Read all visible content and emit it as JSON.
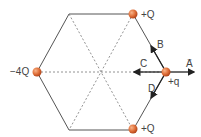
{
  "diagram": {
    "shape": "regular hexagon",
    "charges": [
      {
        "id": "top-right",
        "label": "+Q"
      },
      {
        "id": "bottom-right",
        "label": "+Q"
      },
      {
        "id": "left",
        "label": "−4Q"
      },
      {
        "id": "right",
        "label": "+q"
      }
    ],
    "vectors": [
      {
        "id": "A",
        "label": "A",
        "direction": "right"
      },
      {
        "id": "B",
        "label": "B",
        "direction": "up-left along edge"
      },
      {
        "id": "C",
        "label": "C",
        "direction": "left"
      },
      {
        "id": "D",
        "label": "D",
        "direction": "down-left along edge"
      }
    ],
    "arrow_glyph": "→",
    "colors": {
      "charge": "#e0703a",
      "line": "#555555",
      "dashed": "#777777"
    }
  }
}
